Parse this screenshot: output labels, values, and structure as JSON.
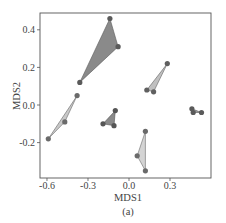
{
  "chart_data": {
    "type": "scatter",
    "title": "",
    "caption": "(a)",
    "xlabel": "MDS1",
    "ylabel": "MDS2",
    "xlim": [
      -0.65,
      0.6
    ],
    "ylim": [
      -0.39,
      0.5
    ],
    "xticks": [
      -0.6,
      -0.3,
      0.0,
      0.3
    ],
    "xtick_labels": [
      "-0.6",
      "-0.3",
      "0.0",
      "0.3"
    ],
    "yticks": [
      -0.2,
      0.0,
      0.2,
      0.4
    ],
    "ytick_labels": [
      "-0.2",
      "0.0",
      "0.2",
      "0.4"
    ],
    "grid": false,
    "legend": null,
    "series": [
      {
        "name": "group-1",
        "fill": "#8a8a8a",
        "point_color": "#5a5a5a",
        "points": [
          [
            -0.14,
            0.46
          ],
          [
            -0.08,
            0.31
          ],
          [
            -0.36,
            0.12
          ]
        ]
      },
      {
        "name": "group-2",
        "fill": "#c8c8c8",
        "point_color": "#6a6a6a",
        "points": [
          [
            -0.38,
            0.05
          ],
          [
            -0.47,
            -0.09
          ],
          [
            -0.59,
            -0.18
          ]
        ]
      },
      {
        "name": "group-3",
        "fill": "#8a8a8a",
        "point_color": "#555555",
        "points": [
          [
            -0.1,
            -0.03
          ],
          [
            -0.19,
            -0.1
          ],
          [
            -0.11,
            -0.11
          ]
        ]
      },
      {
        "name": "group-4",
        "fill": "#c0c0c0",
        "point_color": "#606060",
        "points": [
          [
            0.28,
            0.22
          ],
          [
            0.13,
            0.08
          ],
          [
            0.18,
            0.07
          ]
        ]
      },
      {
        "name": "group-5",
        "fill": "#d4d4d4",
        "point_color": "#6a6a6a",
        "points": [
          [
            0.12,
            -0.14
          ],
          [
            0.06,
            -0.27
          ],
          [
            0.12,
            -0.35
          ]
        ]
      },
      {
        "name": "group-6",
        "fill": "#9a9a9a",
        "point_color": "#5a5a5a",
        "points": [
          [
            0.46,
            -0.02
          ],
          [
            0.47,
            -0.04
          ],
          [
            0.53,
            -0.04
          ]
        ]
      }
    ]
  }
}
